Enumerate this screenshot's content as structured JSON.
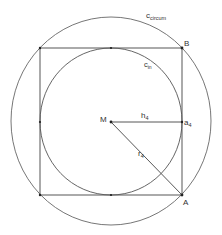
{
  "diagram": {
    "colors": {
      "stroke": "#555555",
      "text": "#333333",
      "background": "#ffffff"
    },
    "labels": {
      "circumcircle": {
        "main": "c",
        "sub": "circum"
      },
      "incircle": {
        "main": "c",
        "sub": "in"
      },
      "center": "M",
      "vertex_top_right": "B",
      "vertex_bottom_right": "A",
      "inradius": {
        "main": "h",
        "sub": "4"
      },
      "circumradius": {
        "main": "r",
        "sub": "4"
      },
      "side_midpoint": {
        "main": "a",
        "sub": "4"
      }
    }
  }
}
